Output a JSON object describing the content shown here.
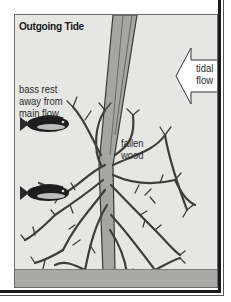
{
  "diagram": {
    "title": "Outgoing Tide",
    "labels": {
      "bass_line1": "bass rest",
      "bass_line2": "away from",
      "bass_line3": "main flow",
      "wood_line1": "fallen",
      "wood_line2": "wood",
      "flow_line1": "tidal",
      "flow_line2": "flow"
    },
    "icons": {
      "arrow": "left-arrow-icon",
      "fish": "bass-fish-icon",
      "tree": "fallen-tree-illustration"
    },
    "colors": {
      "background": "#e6e6e4",
      "ground": "#a9a9a7",
      "trunk": "#9a9a98",
      "outline": "#3a3a3a",
      "frame": "#1a1a1a"
    }
  }
}
